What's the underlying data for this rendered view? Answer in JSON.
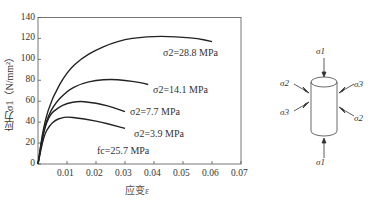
{
  "chart_data": {
    "type": "line",
    "title": "",
    "xlabel": "应变ε",
    "ylabel": "应力σ1（N/mm²）",
    "xlim": [
      0,
      0.07
    ],
    "ylim": [
      0,
      140
    ],
    "x_ticks": [
      "0.01",
      "0.02",
      "0.03",
      "0.04",
      "0.05",
      "0.06",
      "0.07"
    ],
    "y_ticks": [
      "0",
      "20",
      "40",
      "60",
      "80",
      "100",
      "120",
      "140"
    ],
    "grid": false,
    "annotation": "fc=25.7 MPa",
    "series": [
      {
        "name": "σ2=28.8 MPa",
        "x": [
          0,
          0.002,
          0.005,
          0.01,
          0.015,
          0.02,
          0.025,
          0.03,
          0.035,
          0.04,
          0.045,
          0.05,
          0.055,
          0.06
        ],
        "y": [
          0,
          38,
          64,
          88,
          101,
          109,
          115,
          119,
          121,
          122,
          122,
          121,
          120,
          117
        ]
      },
      {
        "name": "σ2=14.1 MPa",
        "x": [
          0,
          0.002,
          0.005,
          0.01,
          0.015,
          0.02,
          0.025,
          0.03,
          0.035,
          0.038
        ],
        "y": [
          0,
          35,
          55,
          70,
          77,
          80,
          81,
          80,
          78,
          76
        ]
      },
      {
        "name": "σ2=7.7 MPa",
        "x": [
          0,
          0.002,
          0.004,
          0.007,
          0.01,
          0.014,
          0.018,
          0.022,
          0.026,
          0.03
        ],
        "y": [
          0,
          32,
          47,
          54,
          58,
          60,
          59,
          57,
          54,
          50
        ]
      },
      {
        "name": "σ2=3.9 MPa",
        "x": [
          0,
          0.002,
          0.004,
          0.006,
          0.008,
          0.01,
          0.014,
          0.018,
          0.022,
          0.026,
          0.03
        ],
        "y": [
          0,
          27,
          37,
          42,
          44,
          45,
          44,
          42,
          40,
          37,
          34
        ]
      }
    ]
  },
  "labels": {
    "s28": "σ2=28.8 MPa",
    "s14": "σ2=14.1 MPa",
    "s77": "σ2=7.7 MPa",
    "s39": "σ2=3.9 MPa",
    "fc": "fc=25.7 MPa"
  },
  "diagram": {
    "top": "σ1",
    "bottom": "σ1",
    "left_upper": "σ2",
    "left_lower": "σ3",
    "right_upper": "σ3",
    "right_lower": "σ2"
  }
}
